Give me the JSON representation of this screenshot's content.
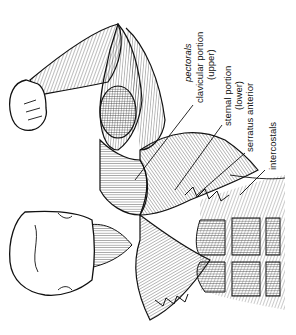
{
  "diagram": {
    "style": "black line drawing on white",
    "colors": {
      "ink": "#111111",
      "background": "#ffffff"
    },
    "labels": {
      "pectorals": "pectorals",
      "clavicular": "clavicular portion",
      "clavicular_sub": "(upper)",
      "sternal": "sternal portion",
      "sternal_sub": "(lower)",
      "serratus": "serratus anterior",
      "intercostals": "intercostals"
    }
  }
}
